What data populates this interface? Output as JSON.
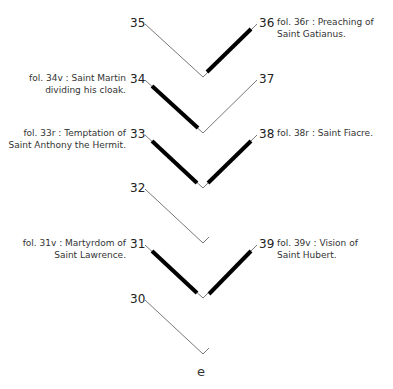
{
  "diagram": {
    "title_fragment": "…ly pig…",
    "gathering_label": "e",
    "folios": [
      {
        "n": "35",
        "side": "left",
        "caption": ""
      },
      {
        "n": "36",
        "side": "right",
        "caption": "fol. 36r : Preaching of\nSaint Gatianus."
      },
      {
        "n": "34",
        "side": "left",
        "caption": "fol. 34v : Saint Martin\ndividing his cloak."
      },
      {
        "n": "37",
        "side": "right",
        "caption": ""
      },
      {
        "n": "33",
        "side": "left",
        "caption": "fol. 33r : Temptation of\nSaint Anthony the Hermit."
      },
      {
        "n": "38",
        "side": "right",
        "caption": "fol. 38r : Saint Fiacre."
      },
      {
        "n": "32",
        "side": "left",
        "caption": ""
      },
      {
        "n": "31",
        "side": "left",
        "caption": "fol. 31v : Martyrdom of\nSaint Lawrence."
      },
      {
        "n": "39",
        "side": "right",
        "caption": "fol. 39v : Vision of\nSaint Hubert."
      },
      {
        "n": "30",
        "side": "left",
        "caption": ""
      }
    ],
    "captions": {
      "f36_l1": "fol. 36r : Preaching of",
      "f36_l2": "Saint Gatianus.",
      "f34_l1": "fol. 34v : Saint Martin",
      "f34_l2": "dividing his cloak.",
      "f33_l1": "fol. 33r : Temptation of",
      "f33_l2": "Saint Anthony the Hermit.",
      "f38_l1": "fol. 38r : Saint Fiacre.",
      "f31_l1": "fol. 31v : Martyrdom of",
      "f31_l2": "Saint Lawrence.",
      "f39_l1": "fol. 39v : Vision of",
      "f39_l2": "Saint Hubert."
    },
    "numbers": {
      "n35": "35",
      "n36": "36",
      "n34": "34",
      "n37": "37",
      "n33": "33",
      "n38": "38",
      "n32": "32",
      "n31": "31",
      "n39": "39",
      "n30": "30"
    },
    "legend": {
      "thick_line": "illustrated leaf (miniature)",
      "thin_line": "leaf without miniature"
    },
    "colors": {
      "line": "#555555",
      "thick": "#000000",
      "text": "#333333"
    }
  }
}
